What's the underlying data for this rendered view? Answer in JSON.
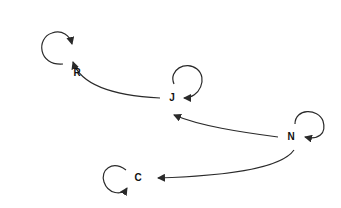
{
  "diagram": {
    "type": "directed-graph",
    "nodes": [
      {
        "id": "R",
        "label": "R",
        "x": 73,
        "y": 72
      },
      {
        "id": "J",
        "label": "J",
        "x": 172,
        "y": 98
      },
      {
        "id": "N",
        "label": "N",
        "x": 291,
        "y": 137
      },
      {
        "id": "C",
        "label": "C",
        "x": 138,
        "y": 178
      }
    ],
    "edges": [
      {
        "from": "J",
        "to": "R"
      },
      {
        "from": "N",
        "to": "J"
      },
      {
        "from": "N",
        "to": "C"
      },
      {
        "from": "R",
        "to": "R",
        "self_loop": true
      },
      {
        "from": "J",
        "to": "J",
        "self_loop": true
      },
      {
        "from": "N",
        "to": "N",
        "self_loop": true
      },
      {
        "from": "C",
        "to": "C",
        "self_loop": true
      }
    ],
    "colors": {
      "edge": "#2a2a2a",
      "label": "#111111",
      "background": "#ffffff"
    }
  }
}
